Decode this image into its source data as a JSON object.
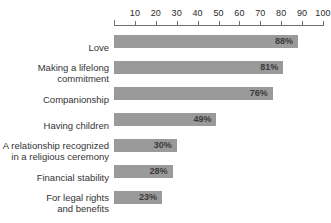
{
  "chart_data": {
    "type": "bar",
    "orientation": "horizontal",
    "title": "",
    "xlabel": "",
    "ylabel": "",
    "xlim": [
      0,
      100
    ],
    "grid": false,
    "legend": null,
    "axis_position": "top",
    "value_suffix": "%",
    "bar_color": "#9a9a9a",
    "axis_color": "#6f6f6f",
    "label_color": "#333333",
    "tick_labels": [
      "10",
      "20",
      "30",
      "40",
      "50",
      "60",
      "70",
      "80",
      "90",
      "100"
    ],
    "ticks": [
      10,
      20,
      30,
      40,
      50,
      60,
      70,
      80,
      90,
      100
    ],
    "categories": [
      "Love",
      "Making a lifelong\ncommitment",
      "Companionship",
      "Having children",
      "A relationship recognized\nin a religious ceremony",
      "Financial stability",
      "For legal rights\nand benefits"
    ],
    "values": [
      88,
      81,
      76,
      49,
      30,
      28,
      23
    ],
    "value_labels": [
      "88%",
      "81%",
      "76%",
      "49%",
      "30%",
      "28%",
      "23%"
    ]
  }
}
